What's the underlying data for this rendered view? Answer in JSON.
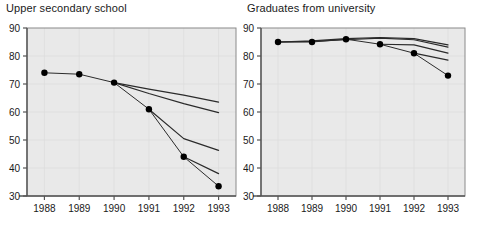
{
  "figure": {
    "background_color": "#ffffff",
    "plot_background_color": "#e9e9e9",
    "axis_color": "#555555",
    "line_color": "#2b2b2b",
    "marker_color": "#000000",
    "grid_color": "#dcdcdc"
  },
  "panels": [
    {
      "id": "upper-secondary-school",
      "title": "Upper secondary school"
    },
    {
      "id": "graduates-from-university",
      "title": "Graduates from university"
    }
  ],
  "chart_data": [
    {
      "type": "line",
      "title": "Upper secondary school",
      "xlabel": "",
      "ylabel": "",
      "x": [
        1988,
        1989,
        1990,
        1991,
        1992,
        1993
      ],
      "xticklabels": [
        "1988",
        "1989",
        "1990",
        "1991",
        "1992",
        "1993"
      ],
      "xlim": [
        1987.5,
        1993.5
      ],
      "ylim": [
        30,
        90
      ],
      "yticks": [
        30,
        40,
        50,
        60,
        70,
        80,
        90
      ],
      "yticklabels": [
        "30",
        "40",
        "50",
        "60",
        "70",
        "80",
        "90"
      ],
      "grid": true,
      "legend": "none",
      "series": [
        {
          "name": "Observed",
          "style": "markers",
          "x": [
            1988,
            1989,
            1990,
            1991,
            1992,
            1993
          ],
          "values": [
            74.0,
            73.5,
            70.5,
            61.0,
            44.0,
            33.5
          ]
        },
        {
          "name": "Forecast from 1990",
          "style": "line",
          "x": [
            1990,
            1991,
            1992,
            1993
          ],
          "values": [
            70.5,
            68.2,
            66.0,
            63.5
          ]
        },
        {
          "name": "Forecast from 1990 lower",
          "style": "line",
          "x": [
            1990,
            1991,
            1992,
            1993
          ],
          "values": [
            70.5,
            66.6,
            63.0,
            59.8
          ]
        },
        {
          "name": "Forecast from 1991",
          "style": "line",
          "x": [
            1991,
            1992,
            1993
          ],
          "values": [
            61.0,
            50.5,
            46.3
          ]
        },
        {
          "name": "Forecast from 1992",
          "style": "line",
          "x": [
            1992,
            1993
          ],
          "values": [
            44.0,
            38.0
          ]
        }
      ]
    },
    {
      "type": "line",
      "title": "Graduates from university",
      "xlabel": "",
      "ylabel": "",
      "x": [
        1988,
        1989,
        1990,
        1991,
        1992,
        1993
      ],
      "xticklabels": [
        "1988",
        "1989",
        "1990",
        "1991",
        "1992",
        "1993"
      ],
      "xlim": [
        1987.5,
        1993.5
      ],
      "ylim": [
        30,
        90
      ],
      "yticks": [
        30,
        40,
        50,
        60,
        70,
        80,
        90
      ],
      "yticklabels": [
        "30",
        "40",
        "50",
        "60",
        "70",
        "80",
        "90"
      ],
      "grid": true,
      "legend": "none",
      "series": [
        {
          "name": "Observed",
          "style": "markers",
          "x": [
            1988,
            1989,
            1990,
            1991,
            1992,
            1993
          ],
          "values": [
            85.0,
            85.0,
            86.0,
            84.2,
            81.0,
            73.0
          ]
        },
        {
          "name": "Forecast upper",
          "style": "line",
          "x": [
            1988,
            1989,
            1990,
            1991,
            1992,
            1993
          ],
          "values": [
            85.0,
            85.4,
            86.2,
            86.6,
            86.2,
            84.0
          ]
        },
        {
          "name": "Forecast middle",
          "style": "line",
          "x": [
            1988,
            1989,
            1990,
            1991,
            1992,
            1993
          ],
          "values": [
            85.0,
            85.2,
            85.8,
            86.4,
            85.8,
            83.2
          ]
        },
        {
          "name": "Forecast from 1991",
          "style": "line",
          "x": [
            1991,
            1992,
            1993
          ],
          "values": [
            84.2,
            84.0,
            81.0
          ]
        },
        {
          "name": "Forecast from 1992",
          "style": "line",
          "x": [
            1992,
            1993
          ],
          "values": [
            81.0,
            78.5
          ]
        }
      ]
    }
  ]
}
